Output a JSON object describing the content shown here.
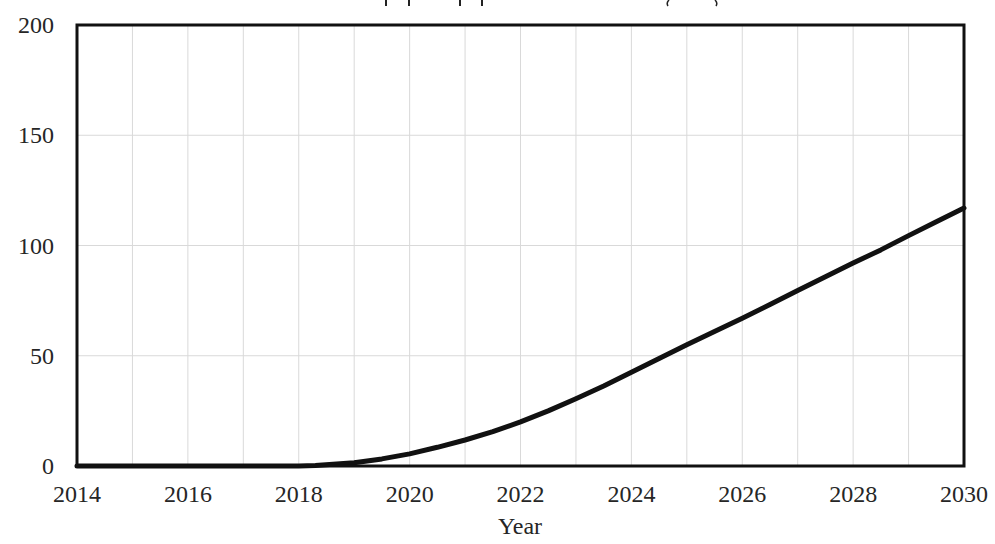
{
  "chart_data": {
    "type": "line",
    "title": "",
    "title_note": "Title cropped at top edge; only descender fragments visible",
    "xlabel": "Year",
    "ylabel": "",
    "xlim": [
      2014,
      2030
    ],
    "ylim": [
      0,
      200
    ],
    "x_ticks": [
      "2014",
      "2016",
      "2018",
      "2020",
      "2022",
      "2024",
      "2026",
      "2028",
      "2030"
    ],
    "y_ticks": [
      "0",
      "50",
      "100",
      "150",
      "200"
    ],
    "grid": {
      "vertical_every": 1,
      "horizontal_every": 50,
      "color": "#d9d9d9"
    },
    "legend": null,
    "series": [
      {
        "name": "",
        "color": "#111111",
        "x": [
          2014,
          2015,
          2016,
          2017,
          2018,
          2018.3,
          2019,
          2019.5,
          2020,
          2020.5,
          2021,
          2021.5,
          2022,
          2022.5,
          2023,
          2023.5,
          2024,
          2024.5,
          2025,
          2025.5,
          2026,
          2026.5,
          2027,
          2027.5,
          2028,
          2028.5,
          2029,
          2029.5,
          2030
        ],
        "values": [
          0,
          0,
          0,
          0,
          0,
          0.2,
          1.5,
          3.2,
          5.5,
          8.5,
          11.8,
          15.6,
          20,
          25,
          30.5,
          36.3,
          42.5,
          48.8,
          55,
          61,
          67,
          73.2,
          79.6,
          85.8,
          92,
          98,
          104.5,
          110.8,
          117
        ]
      }
    ]
  },
  "title": {
    "text": ""
  },
  "axes": {
    "x_title": "Year",
    "x_ticks": [
      "2014",
      "2016",
      "2018",
      "2020",
      "2022",
      "2024",
      "2026",
      "2028",
      "2030"
    ],
    "y_ticks": [
      "0",
      "50",
      "100",
      "150",
      "200"
    ]
  }
}
